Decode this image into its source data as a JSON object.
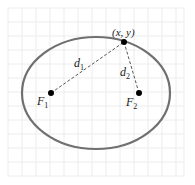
{
  "diagram": {
    "point_label": "(x, y)",
    "focus1": {
      "letter": "F",
      "sub": "1"
    },
    "focus2": {
      "letter": "F",
      "sub": "2"
    },
    "distance1": {
      "letter": "d",
      "sub": "1"
    },
    "distance2": {
      "letter": "d",
      "sub": "2"
    },
    "colors": {
      "ellipse": "#707070",
      "grid": "#ececec",
      "dashed": "#555555",
      "points": "#000000"
    }
  }
}
